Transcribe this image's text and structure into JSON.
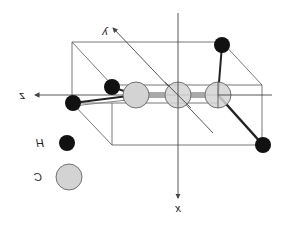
{
  "diagram": {
    "mirrored": true,
    "axes": [
      {
        "name": "x",
        "label": "x"
      },
      {
        "name": "y",
        "label": "y"
      },
      {
        "name": "z",
        "label": "z"
      }
    ],
    "atoms": {
      "carbons": [
        {
          "id": "C1",
          "cx": 136,
          "cy": 95
        },
        {
          "id": "C2",
          "cx": 178,
          "cy": 95
        },
        {
          "id": "C3",
          "cx": 218,
          "cy": 95
        }
      ],
      "hydrogens": [
        {
          "id": "H1",
          "cx": 112,
          "cy": 87
        },
        {
          "id": "H2",
          "cx": 73,
          "cy": 103
        },
        {
          "id": "H3",
          "cx": 222,
          "cy": 45
        },
        {
          "id": "H4",
          "cx": 263,
          "cy": 145
        }
      ]
    },
    "legend": [
      {
        "symbol": "H",
        "label": "H",
        "color": "#111111"
      },
      {
        "symbol": "C",
        "label": "C",
        "color": "#d3d3d3"
      }
    ],
    "colors": {
      "hydrogen": "#111111",
      "carbon": "#d3d3d3",
      "carbon_stroke": "#555555",
      "line": "#444444"
    }
  }
}
